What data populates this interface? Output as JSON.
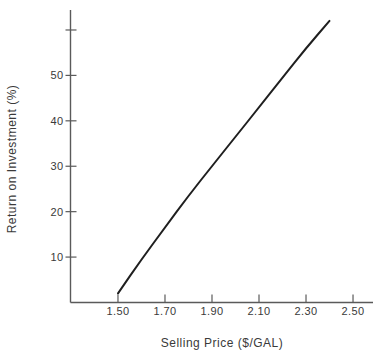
{
  "figure": {
    "background": "#ffffff",
    "text_color": "#3a3a3a",
    "axis_color": "#5a5a5a"
  },
  "chart_data": {
    "type": "line",
    "xlabel": "Selling Price ($/GAL)",
    "ylabel": "Return on Investment (%)",
    "x": [
      1.5,
      1.6,
      1.7,
      1.8,
      1.9,
      2.0,
      2.1,
      2.2,
      2.3,
      2.4
    ],
    "series": [
      {
        "name": "return-on-investment-vs-selling-price",
        "values": [
          2,
          9.5,
          16.5,
          23.5,
          30,
          36.5,
          43,
          49.5,
          56,
          62
        ],
        "color": "#1f1f1f",
        "width": 2
      }
    ],
    "xlim": [
      1.298,
      2.585
    ],
    "ylim": [
      0,
      64.4
    ],
    "x_ticks": [
      {
        "value": 1.5,
        "label": "1.50"
      },
      {
        "value": 1.7,
        "label": "1.70"
      },
      {
        "value": 1.9,
        "label": "1.90"
      },
      {
        "value": 2.1,
        "label": "2.10"
      },
      {
        "value": 2.3,
        "label": "2.30"
      },
      {
        "value": 2.5,
        "label": "2.50"
      }
    ],
    "y_ticks": [
      {
        "value": 10,
        "label": "10"
      },
      {
        "value": 20,
        "label": "20"
      },
      {
        "value": 30,
        "label": "30"
      },
      {
        "value": 40,
        "label": "40"
      },
      {
        "value": 50,
        "label": "50"
      },
      {
        "value": 60,
        "label": ""
      }
    ],
    "grid": false,
    "legend": null
  }
}
